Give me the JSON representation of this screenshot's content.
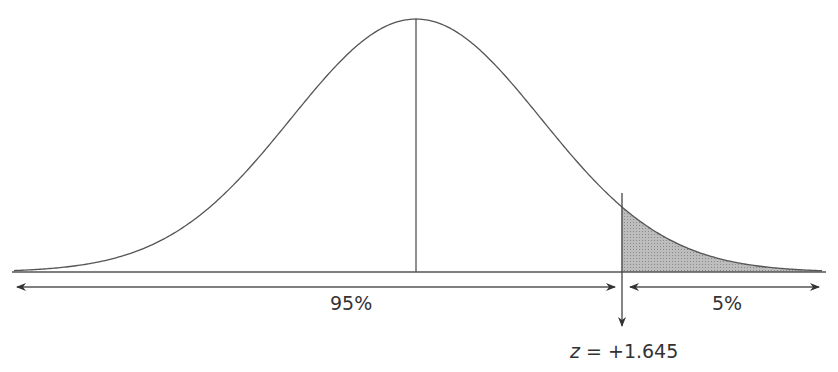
{
  "chart_data": {
    "type": "area",
    "title": "",
    "mean": 0,
    "critical_value": 1.645,
    "regions": [
      {
        "name": "left",
        "label": "95%",
        "proportion": 0.95,
        "shaded": false
      },
      {
        "name": "right-tail",
        "label": "5%",
        "proportion": 0.05,
        "shaded": true
      }
    ],
    "annotation": "z = +1.645",
    "xlabel": "",
    "ylabel": "",
    "grid": false,
    "legend": false
  },
  "labels": {
    "left_region": "95%",
    "right_region": "5%",
    "z_prefix": "z",
    "z_value": " = +1.645"
  },
  "colors": {
    "line": "#555555",
    "shade": "#a9a9a9"
  }
}
